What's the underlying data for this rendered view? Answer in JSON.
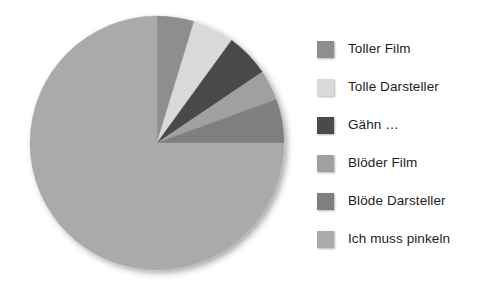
{
  "chart_data": {
    "type": "pie",
    "title": "",
    "subtitle": "",
    "xlabel": "",
    "ylabel": "",
    "grid": false,
    "legend_position": "right",
    "start_angle_deg": 0,
    "direction": "clockwise",
    "categories": [
      "Toller Film",
      "Tolle Darsteller",
      "Gähn …",
      "Blöder Film",
      "Blöde Darsteller",
      "Ich muss pinkeln"
    ],
    "values": [
      4.7,
      5.3,
      5.6,
      3.9,
      5.5,
      75.0
    ],
    "angles_deg": [
      17,
      19,
      20,
      14,
      20,
      270
    ],
    "colors": [
      "#8e8e8e",
      "#d9d9d9",
      "#4a4a4a",
      "#a0a0a0",
      "#7f7f7f",
      "#aaaaaa"
    ],
    "slices": [
      {
        "label": "Toller Film",
        "value": 4.7,
        "angle_deg": 17,
        "color": "#8e8e8e"
      },
      {
        "label": "Tolle Darsteller",
        "value": 5.3,
        "angle_deg": 19,
        "color": "#d9d9d9"
      },
      {
        "label": "Gähn …",
        "value": 5.6,
        "angle_deg": 20,
        "color": "#4a4a4a"
      },
      {
        "label": "Blöder Film",
        "value": 3.9,
        "angle_deg": 14,
        "color": "#a0a0a0"
      },
      {
        "label": "Blöde Darsteller",
        "value": 5.5,
        "angle_deg": 20,
        "color": "#7f7f7f"
      },
      {
        "label": "Ich muss pinkeln",
        "value": 75.0,
        "angle_deg": 270,
        "color": "#aaaaaa"
      }
    ]
  },
  "legend": {
    "items": [
      {
        "label": "Toller Film",
        "color": "#8e8e8e"
      },
      {
        "label": "Tolle Darsteller",
        "color": "#d9d9d9"
      },
      {
        "label": "Gähn …",
        "color": "#4a4a4a"
      },
      {
        "label": "Blöder Film",
        "color": "#a0a0a0"
      },
      {
        "label": "Blöde Darsteller",
        "color": "#7f7f7f"
      },
      {
        "label": "Ich muss pinkeln",
        "color": "#aaaaaa"
      }
    ]
  },
  "pie_geometry": {
    "cx": 157,
    "cy": 143,
    "r": 127
  }
}
